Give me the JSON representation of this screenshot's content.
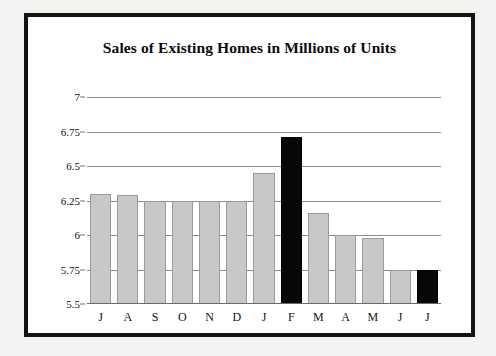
{
  "figure": {
    "border_color": "#14130f",
    "background_color": "#ffffff"
  },
  "chart_data": {
    "type": "bar",
    "title": "Sales of Existing Homes in Millions of Units",
    "xlabel": "",
    "ylabel": "",
    "ylim": [
      5.5,
      7
    ],
    "yticks": [
      "5.5",
      "5.75",
      "6",
      "6.25",
      "6.5",
      "6.75",
      "7"
    ],
    "ytick_values": [
      5.5,
      5.75,
      6,
      6.25,
      6.5,
      6.75,
      7
    ],
    "grid": true,
    "legend": "none",
    "categories": [
      "J",
      "A",
      "S",
      "O",
      "N",
      "D",
      "J",
      "F",
      "M",
      "A",
      "M",
      "J",
      "J"
    ],
    "values": [
      6.3,
      6.29,
      6.25,
      6.25,
      6.25,
      6.25,
      6.45,
      6.71,
      6.16,
      6.0,
      5.98,
      5.75,
      5.75
    ],
    "bar_colors": [
      "#c8c8c6",
      "#c8c8c6",
      "#c8c8c6",
      "#c8c8c6",
      "#c8c8c6",
      "#c8c8c6",
      "#c8c8c6",
      "#080707",
      "#c8c8c6",
      "#c8c8c6",
      "#c8c8c6",
      "#c8c8c6",
      "#080707"
    ],
    "highlight_color": "#080707",
    "series_color": "#c8c8c6",
    "gridline_color": "#8a8a8a"
  }
}
